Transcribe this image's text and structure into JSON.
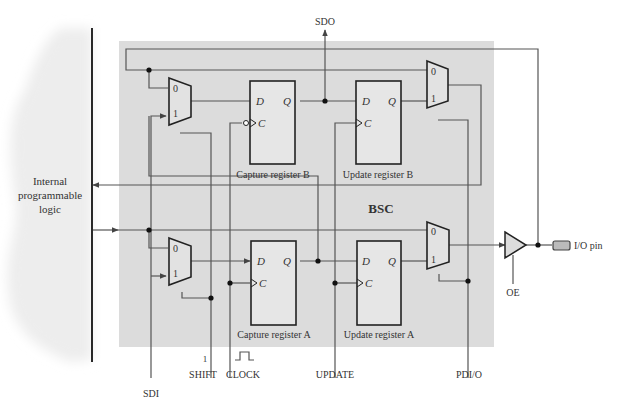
{
  "diagram": {
    "block_label": "BSC",
    "left_block": {
      "line1": "Internal",
      "line2": "programmable",
      "line3": "logic"
    },
    "signals": {
      "sdo": "SDO",
      "sdi": "SDI",
      "shift": "SHIFT",
      "shift_value": "1",
      "clock": "CLOCK",
      "update": "UPDATE",
      "pdio": "PDI/O",
      "oe": "OE",
      "io_pin": "I/O pin"
    },
    "registers": [
      {
        "id": "capture_b",
        "label": "Capture register B",
        "d": "D",
        "q": "Q",
        "c": "C",
        "inverted_clock": true
      },
      {
        "id": "update_b",
        "label": "Update register B",
        "d": "D",
        "q": "Q",
        "c": "C",
        "inverted_clock": false
      },
      {
        "id": "capture_a",
        "label": "Capture register A",
        "d": "D",
        "q": "Q",
        "c": "C",
        "inverted_clock": false
      },
      {
        "id": "update_a",
        "label": "Update register A",
        "d": "D",
        "q": "Q",
        "c": "C",
        "inverted_clock": false
      }
    ],
    "muxes": [
      {
        "id": "mux_in_b",
        "in0": "0",
        "in1": "1"
      },
      {
        "id": "mux_out_b",
        "in0": "0",
        "in1": "1"
      },
      {
        "id": "mux_in_a",
        "in0": "0",
        "in1": "1"
      },
      {
        "id": "mux_out_a",
        "in0": "0",
        "in1": "1"
      }
    ],
    "colors": {
      "bsc_fill": "#dcdcdc",
      "wire": "#555555",
      "cloud": "#eeeeee"
    }
  }
}
